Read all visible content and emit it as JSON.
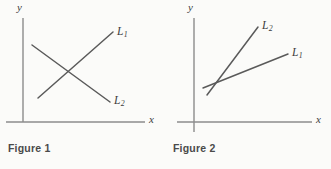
{
  "page": {
    "background_color": "#fbfbf9",
    "line_color": "#5a5a5a",
    "axis_color": "#8c8c8c",
    "text_color": "#3c3c3c",
    "caption_color": "#4a4a4a"
  },
  "figures": [
    {
      "caption": "Figure 1",
      "axes": {
        "y_label": "y",
        "x_label": "x"
      },
      "lines": [
        {
          "name": "L",
          "subscript": "1",
          "description": "upward sloping line",
          "x1": 38,
          "y1": 98,
          "x2": 113,
          "y2": 32,
          "label_x": 117,
          "label_y": 26
        },
        {
          "name": "L",
          "subscript": "2",
          "description": "downward sloping line",
          "x1": 32,
          "y1": 45,
          "x2": 110,
          "y2": 102,
          "label_x": 114,
          "label_y": 95
        }
      ]
    },
    {
      "caption": "Figure 2",
      "axes": {
        "y_label": "y",
        "x_label": "x"
      },
      "lines": [
        {
          "name": "L",
          "subscript": "2",
          "description": "steep upward sloping line",
          "x1": 42,
          "y1": 95,
          "x2": 93,
          "y2": 27,
          "label_x": 97,
          "label_y": 20
        },
        {
          "name": "L",
          "subscript": "1",
          "description": "shallow upward sloping line",
          "x1": 38,
          "y1": 88,
          "x2": 123,
          "y2": 54,
          "label_x": 127,
          "label_y": 47
        }
      ]
    }
  ]
}
